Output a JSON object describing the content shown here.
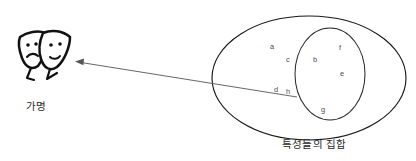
{
  "diagram": {
    "title_pseudonym": "가명",
    "title_set": "특성들의 집합",
    "colors": {
      "background": "#ffffff",
      "outline": "#1a1a1a",
      "inner_outline": "#2b2b2b",
      "letter": "#4a4a4a",
      "pointer": "#555555",
      "mask_ink": "#111111"
    },
    "icon": {
      "name": "theater-masks-icon",
      "description": "two overlapping theater masks with legs"
    },
    "pointer": {
      "name": "arrow-pointer",
      "direction": "left",
      "from": "inner-set-boundary",
      "to": "theater-masks-icon"
    },
    "outer_set": {
      "name": "set-of-characteristics",
      "label": "특성들의 집합",
      "members": [
        "a",
        "c",
        "d",
        "h"
      ]
    },
    "inner_set": {
      "name": "pseudonym-subset",
      "members": [
        "b",
        "f",
        "e",
        "g"
      ]
    },
    "elements": [
      {
        "letter": "a",
        "x": 270,
        "y": 49,
        "group": "outer"
      },
      {
        "letter": "c",
        "x": 286,
        "y": 62,
        "group": "outer"
      },
      {
        "letter": "d",
        "x": 274,
        "y": 92,
        "group": "outer"
      },
      {
        "letter": "h",
        "x": 286,
        "y": 94,
        "group": "outer"
      },
      {
        "letter": "b",
        "x": 313,
        "y": 62,
        "group": "inner"
      },
      {
        "letter": "f",
        "x": 339,
        "y": 50,
        "group": "inner"
      },
      {
        "letter": "e",
        "x": 340,
        "y": 76,
        "group": "inner"
      },
      {
        "letter": "g",
        "x": 321,
        "y": 112,
        "group": "inner"
      }
    ]
  }
}
